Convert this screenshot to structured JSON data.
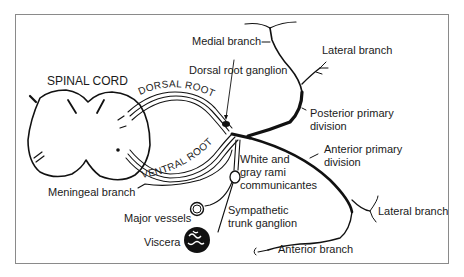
{
  "diagram": {
    "type": "anatomical",
    "labels": {
      "spinal_cord": "SPINAL CORD",
      "dorsal_root": "DORSAL ROOT",
      "ventral_root": "VENTRAL ROOT",
      "medial_branch": "Medial branch",
      "lateral_branch_posterior": "Lateral branch",
      "dorsal_root_ganglion": "Dorsal root ganglion",
      "posterior_primary_division_1": "Posterior primary",
      "posterior_primary_division_2": "division",
      "anterior_primary_division_1": "Anterior primary",
      "anterior_primary_division_2": "division",
      "white_gray_rami_1": "White and",
      "white_gray_rami_2": "gray rami",
      "white_gray_rami_3": "communicantes",
      "meningeal_branch": "Meningeal branch",
      "major_vessels": "Major vessels",
      "sympathetic_ganglion_1": "Sympathetic",
      "sympathetic_ganglion_2": "trunk ganglion",
      "viscera": "Viscera",
      "lateral_branch_anterior": "Lateral branch",
      "anterior_branch": "Anterior branch"
    },
    "colors": {
      "ink": "#111111",
      "frame": "#8a8a8a",
      "background": "#ffffff"
    }
  }
}
